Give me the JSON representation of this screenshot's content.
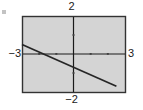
{
  "figure": {
    "width": 143,
    "height": 110,
    "background_color": "#ffffff",
    "artifact_name": "speck-artifact"
  },
  "plot": {
    "box": {
      "left": 22,
      "top": 16,
      "right": 125,
      "bottom": 92
    },
    "fill_color": "#d4d4d4",
    "border_color": "#333333",
    "axis_color": "#1a1a1a",
    "curve_color": "#262626"
  },
  "labels": {
    "ymax": "2",
    "ymin": "−2",
    "xmin": "−3",
    "xmax": "3"
  },
  "chart_data": {
    "type": "line",
    "title": "",
    "xlabel": "",
    "ylabel": "",
    "xlim": [
      -3,
      3
    ],
    "ylim": [
      -2,
      2
    ],
    "grid": false,
    "legend": "none",
    "xticks": [
      -3,
      -2,
      -1,
      0,
      1,
      2,
      3
    ],
    "yticks": [
      -2,
      -1,
      0,
      1,
      2
    ],
    "xtick_labels": [
      "-3",
      "",
      "",
      "",
      "",
      "",
      "3"
    ],
    "ytick_labels": [
      "-2",
      "",
      "",
      "",
      "2"
    ],
    "series": [
      {
        "name": "line",
        "equation": "y = -0.4x - 0.7",
        "slope": -0.4,
        "intercept": -0.7,
        "x": [
          -3,
          -2,
          -1,
          0,
          1,
          2,
          2.5
        ],
        "y": [
          0.5,
          0.1,
          -0.3,
          -0.7,
          -1.1,
          -1.5,
          -1.7
        ]
      }
    ],
    "annotations": [
      {
        "name": "x-intercept",
        "x": -1.75,
        "y": 0
      },
      {
        "name": "y-intercept",
        "x": 0,
        "y": -0.7
      }
    ]
  }
}
